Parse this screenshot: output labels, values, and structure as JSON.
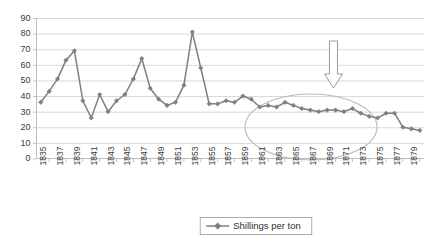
{
  "chart_data": {
    "type": "line",
    "title": "",
    "xlabel": "",
    "ylabel": "",
    "ylim": [
      0,
      90
    ],
    "ytick_step": 10,
    "yticks": [
      "0",
      "10",
      "20",
      "30",
      "40",
      "50",
      "60",
      "70",
      "80",
      "90"
    ],
    "grid": true,
    "legend_position": "bottom",
    "x": [
      1835,
      1836,
      1837,
      1838,
      1839,
      1840,
      1841,
      1842,
      1843,
      1844,
      1845,
      1846,
      1847,
      1848,
      1849,
      1850,
      1851,
      1852,
      1853,
      1854,
      1855,
      1856,
      1857,
      1858,
      1859,
      1860,
      1861,
      1862,
      1863,
      1864,
      1865,
      1866,
      1867,
      1868,
      1869,
      1870,
      1871,
      1872,
      1873,
      1874,
      1875,
      1876,
      1877,
      1878,
      1879,
      1880
    ],
    "xtick_labels": [
      "1835",
      "1837",
      "1839",
      "1841",
      "1843",
      "1845",
      "1847",
      "1849",
      "1851",
      "1853",
      "1855",
      "1857",
      "1859",
      "1861",
      "1863",
      "1865",
      "1867",
      "1869",
      "1871",
      "1873",
      "1875",
      "1877",
      "1879"
    ],
    "series": [
      {
        "name": "Shillings per ton",
        "color": "#7f7f7f",
        "values": [
          36,
          43,
          51,
          63,
          69,
          37,
          26,
          41,
          30,
          37,
          41,
          51,
          64,
          45,
          38,
          34,
          36,
          47,
          81,
          58,
          35,
          35,
          37,
          36,
          40,
          38,
          33,
          34,
          33,
          36,
          34,
          32,
          31,
          30,
          31,
          31,
          30,
          32,
          29,
          27,
          26,
          29,
          29,
          20,
          19,
          18
        ]
      }
    ],
    "annotations": [
      {
        "kind": "ellipse",
        "name": "highlight-ellipse",
        "note": "stable low-price period"
      },
      {
        "kind": "arrow-down",
        "name": "down-arrow",
        "note": "decline indicator"
      }
    ]
  },
  "legend": {
    "entries": [
      {
        "label": "Shillings per ton"
      }
    ]
  }
}
